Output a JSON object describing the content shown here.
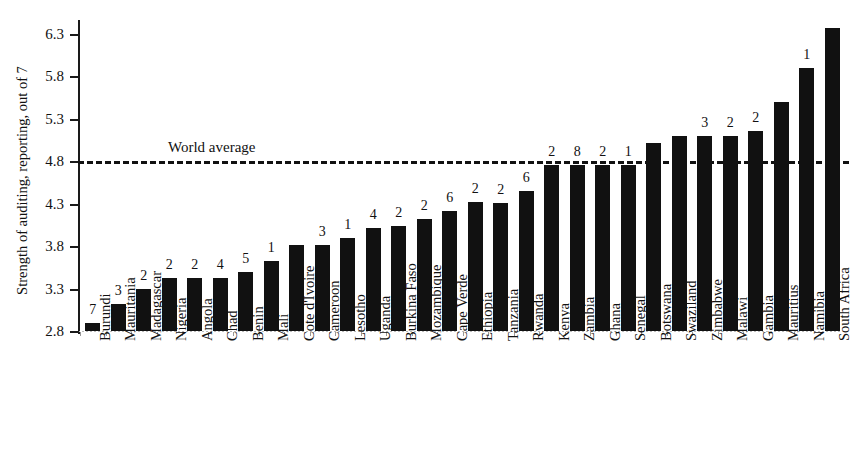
{
  "chart_data": {
    "type": "bar",
    "title": "",
    "xlabel": "",
    "ylabel": "Strength of auditing, reporting, out of 7",
    "ylim": [
      2.8,
      6.3
    ],
    "yticks": [
      "2.8",
      "3.3",
      "3.8",
      "4.3",
      "4.8",
      "5.3",
      "5.8",
      "6.3"
    ],
    "grid": false,
    "legend": "none",
    "bar_color": "#111111",
    "annotations": [
      {
        "label": "World average",
        "type": "reference-line",
        "value": 4.8,
        "style": "dashed"
      }
    ],
    "categories": [
      "Burundi",
      "Mauritania",
      "Madagascar",
      "Nigeria",
      "Angola",
      "Chad",
      "Benin",
      "Mali",
      "Cote d'Ivoire",
      "Cameroon",
      "Lesotho",
      "Uganda",
      "Burkina Faso",
      "Mozambique",
      "Cape Verde",
      "Ethiopia",
      "Tanzania",
      "Rwanda",
      "Kenya",
      "Zambia",
      "Ghana",
      "Senegal",
      "Botswana",
      "Swaziland",
      "Zimbabwe",
      "Malawi",
      "Gambia",
      "Mauritius",
      "Namibia",
      "South Africa"
    ],
    "values": [
      2.9,
      3.12,
      3.3,
      3.42,
      3.42,
      3.42,
      3.5,
      3.63,
      3.81,
      3.81,
      3.9,
      4.01,
      4.04,
      4.12,
      4.22,
      4.32,
      4.31,
      4.45,
      4.76,
      4.76,
      4.76,
      4.76,
      5.02,
      5.1,
      5.1,
      5.1,
      5.16,
      5.5,
      5.9,
      6.37
    ],
    "data_labels": [
      "7",
      "3",
      "2",
      "2",
      "2",
      "4",
      "5",
      "1",
      "",
      "3",
      "1",
      "4",
      "2",
      "2",
      "6",
      "2",
      "2",
      "6",
      "2",
      "8",
      "2",
      "1",
      "",
      "",
      "3",
      "2",
      "2",
      "",
      "1",
      ""
    ]
  },
  "axis": {
    "y_title": "Strength of auditing, reporting, out of 7"
  },
  "reference": {
    "world_average_label": "World average"
  }
}
